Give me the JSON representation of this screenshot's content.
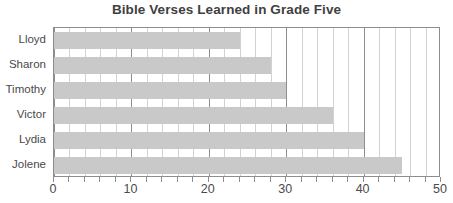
{
  "chart_data": {
    "type": "bar",
    "orientation": "horizontal",
    "title": "Bible Verses Learned in Grade Five",
    "xlabel": "",
    "ylabel": "",
    "categories": [
      "Lloyd",
      "Sharon",
      "Timothy",
      "Victor",
      "Lydia",
      "Jolene"
    ],
    "values": [
      24,
      28,
      30,
      36,
      40,
      45
    ],
    "xlim": [
      0,
      50
    ],
    "xticks": [
      0,
      10,
      20,
      30,
      40,
      50
    ],
    "xtick_labels": [
      "0",
      "10",
      "20",
      "30",
      "40",
      "50"
    ],
    "minor_tick_step": 2,
    "grid": true,
    "legend": null,
    "colors": {
      "bar_fill": "#c9c9c9",
      "frame": "#8d8d8d",
      "minor_gridline": "#d2d2d2",
      "major_gridline": "#8d8d8d",
      "title_text": "#3f3f3f",
      "label_text": "#4a4a4a",
      "background": "#ffffff"
    }
  }
}
